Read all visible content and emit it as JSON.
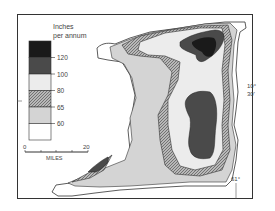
{
  "map": {
    "subject": "Annual rainfall",
    "legend": {
      "title_line1": "Inches",
      "title_line2": "per annum",
      "classes": [
        {
          "label": "over 120",
          "fill": "#1a1a1a",
          "pattern": "solid"
        },
        {
          "label": "100-120",
          "fill": "#4a4a4a",
          "pattern": "solid"
        },
        {
          "label": "80-100",
          "fill": "#ececec",
          "pattern": "solid"
        },
        {
          "label": "65-80",
          "fill": "#a8a8a8",
          "pattern": "hatch"
        },
        {
          "label": "60-65",
          "fill": "#d4d4d4",
          "pattern": "solid"
        },
        {
          "label": "under 60",
          "fill": "#ffffff",
          "pattern": "solid"
        }
      ],
      "tick_labels": [
        "120",
        "100",
        "80",
        "65",
        "60"
      ]
    },
    "scale_bar": {
      "start_label": "0",
      "end_label": "20",
      "unit_label": "MILES"
    },
    "coordinates": {
      "lat_deg": "10°",
      "lat_min": "30'",
      "lon": "61°"
    }
  }
}
